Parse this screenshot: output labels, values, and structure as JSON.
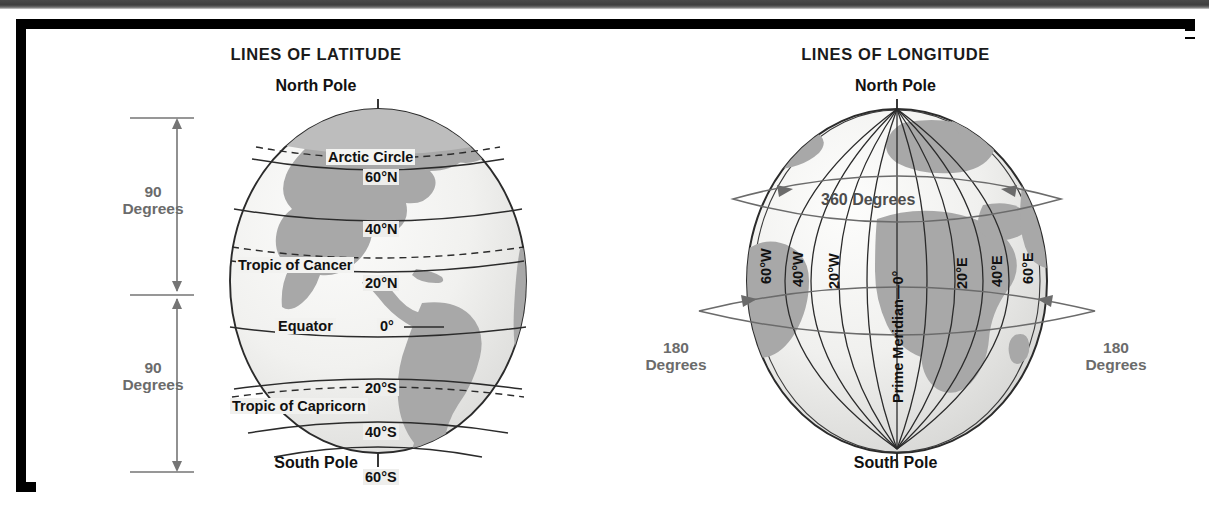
{
  "figure": {
    "panels": [
      {
        "id": "latitude",
        "title": "LINES OF LATITUDE",
        "north_pole": "North Pole",
        "south_pole": "South Pole",
        "bracket": [
          {
            "number": "90",
            "word": "Degrees"
          },
          {
            "number": "90",
            "word": "Degrees"
          }
        ],
        "lines": [
          {
            "label": "Arctic Circle",
            "value": "",
            "dashed": true
          },
          {
            "label": "",
            "value": "60°N",
            "dashed": false
          },
          {
            "label": "",
            "value": "40°N",
            "dashed": false
          },
          {
            "label": "Tropic of Cancer",
            "value": "",
            "dashed": true
          },
          {
            "label": "",
            "value": "20°N",
            "dashed": false
          },
          {
            "label": "Equator",
            "value": "0°",
            "dashed": false
          },
          {
            "label": "",
            "value": "20°S",
            "dashed": false
          },
          {
            "label": "Tropic of Capricorn",
            "value": "",
            "dashed": true
          },
          {
            "label": "",
            "value": "40°S",
            "dashed": false
          },
          {
            "label": "",
            "value": "60°S",
            "dashed": false
          }
        ]
      },
      {
        "id": "longitude",
        "title": "LINES OF LONGITUDE",
        "north_pole": "North Pole",
        "south_pole": "South Pole",
        "equator_ring_label": "360 Degrees",
        "left_ring": {
          "number": "180",
          "word": "Degrees"
        },
        "right_ring": {
          "number": "180",
          "word": "Degrees"
        },
        "meridians": [
          "60°W",
          "40°W",
          "20°W",
          "Prime Meridian—0°",
          "20°E",
          "40°E",
          "60°E"
        ]
      }
    ]
  },
  "colors": {
    "frame_border": "#000000",
    "frame_dash": "#ffffff",
    "top_bar": "#454545",
    "ocean": "#f2f2f0",
    "land": "#a8a8a8",
    "grid_line": "#2b2b2b",
    "degree_text": "#6b6b6b",
    "title_text": "#1a1a1a",
    "page_bg": "#ffffff"
  }
}
